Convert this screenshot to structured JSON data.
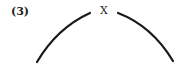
{
  "figure": {
    "label": "(3)",
    "apex_label": "X",
    "stroke_color": "#1a1a1a",
    "arcs": [
      {
        "name": "left-arc",
        "from": [
          37,
          62
        ],
        "ctrl": [
          57,
          28
        ],
        "to": [
          90,
          13
        ]
      },
      {
        "name": "right-arc",
        "from": [
          118,
          13
        ],
        "ctrl": [
          152,
          26
        ],
        "to": [
          173,
          61
        ]
      }
    ]
  }
}
